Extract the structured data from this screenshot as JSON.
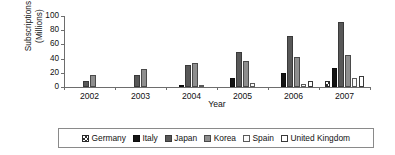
{
  "chart_data": {
    "type": "bar",
    "title": "",
    "xlabel": "Year",
    "ylabel": "Subscriptions\n(Millions)",
    "ylabel_line1": "Subscriptions",
    "ylabel_line2": "(Millions)",
    "categories": [
      "2002",
      "2003",
      "2004",
      "2005",
      "2006",
      "2007"
    ],
    "ylim": [
      0,
      100
    ],
    "yticks": [
      0,
      20,
      40,
      60,
      80,
      100
    ],
    "ytick_labels": [
      "0",
      "20",
      "40",
      "60",
      "80",
      "100"
    ],
    "grid": false,
    "legend_position": "bottom",
    "series": [
      {
        "name": "Germany",
        "color": "#ffffff",
        "pattern": "checkered",
        "swatch_class": "s-germany",
        "values": [
          0,
          0,
          0,
          0,
          0,
          9
        ]
      },
      {
        "name": "Italy",
        "color": "#141414",
        "pattern": "solid-black",
        "swatch_class": "s-italy",
        "values": [
          0,
          0,
          3.5,
          12,
          20,
          27
        ]
      },
      {
        "name": "Japan",
        "color": "#585858",
        "pattern": "dark-gray",
        "swatch_class": "s-japan",
        "values": [
          8,
          17,
          31,
          50,
          72,
          91
        ]
      },
      {
        "name": "Korea",
        "color": "#8e8e8e",
        "pattern": "medium-gray",
        "swatch_class": "s-korea",
        "values": [
          17,
          25,
          34,
          37,
          42,
          45
        ]
      },
      {
        "name": "Spain",
        "color": "#fbfbfb",
        "pattern": "white-outline",
        "swatch_class": "s-spain",
        "values": [
          0,
          0,
          3,
          5,
          4,
          12
        ]
      },
      {
        "name": "United Kingdom",
        "color": "#ffffff",
        "pattern": "white-outline",
        "swatch_class": "s-uk",
        "values": [
          0,
          0,
          0,
          0,
          9,
          15
        ]
      }
    ]
  }
}
